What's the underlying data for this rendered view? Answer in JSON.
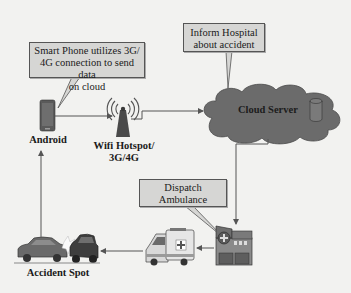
{
  "diagram": {
    "callouts": {
      "smartphone": {
        "lines": [
          "Smart Phone utilizes 3G/",
          "4G connection to send data",
          "on cloud"
        ]
      },
      "hospital": {
        "lines": [
          "Inform Hospital",
          "about accident"
        ]
      },
      "dispatch": {
        "lines": [
          "Dispatch",
          "Ambulance"
        ]
      }
    },
    "nodes": {
      "android": {
        "label": "Android",
        "icon": "smartphone-icon"
      },
      "wifi": {
        "label_lines": [
          "Wifi Hotspot/",
          "3G/4G"
        ],
        "icon": "wifi-tower-icon"
      },
      "cloud": {
        "label": "Cloud Server",
        "icon": "cloud-icon",
        "db_icon": "database-icon"
      },
      "hospital": {
        "icon": "hospital-icon"
      },
      "ambulance": {
        "icon": "ambulance-icon"
      },
      "accident": {
        "label": "Accident Spot",
        "icon": "car-crash-icon"
      }
    },
    "flow": [
      "Accident Spot -> Android",
      "Android -> Wifi Hotspot/3G/4G",
      "Wifi Hotspot/3G/4G -> Cloud Server",
      "Cloud Server -> Hospital",
      "Hospital -> Ambulance",
      "Ambulance -> Accident Spot"
    ],
    "colors": {
      "background": "#f2f2f0",
      "callout_fill": "#d6d6d4",
      "cloud_fill": "#6b6b6b",
      "line": "#555555"
    }
  }
}
